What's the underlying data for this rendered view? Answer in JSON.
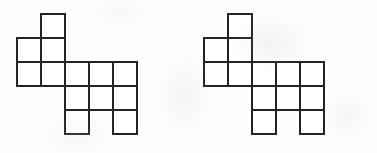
{
  "document": {
    "kind": "scanned-worksheet-figure",
    "background_color": "#fdfdfc",
    "stroke_color": "#242424",
    "stroke_width": 2.6,
    "cell_size": 24,
    "figure_count": 2
  },
  "figures": [
    {
      "id": "figure-left",
      "label": "polyomino-figure-left",
      "origin": {
        "x": 17,
        "y": 14
      },
      "grid_rows": 5,
      "grid_cols": 5,
      "cells": [
        {
          "row": 1,
          "col": 2
        },
        {
          "row": 2,
          "col": 1
        },
        {
          "row": 2,
          "col": 2
        },
        {
          "row": 3,
          "col": 1
        },
        {
          "row": 3,
          "col": 2
        },
        {
          "row": 3,
          "col": 3
        },
        {
          "row": 3,
          "col": 4
        },
        {
          "row": 3,
          "col": 5
        },
        {
          "row": 4,
          "col": 3
        },
        {
          "row": 4,
          "col": 4
        },
        {
          "row": 4,
          "col": 5
        },
        {
          "row": 5,
          "col": 3
        },
        {
          "row": 5,
          "col": 5
        }
      ]
    },
    {
      "id": "figure-right",
      "label": "polyomino-figure-right",
      "origin": {
        "x": 17,
        "y": 14
      },
      "grid_rows": 5,
      "grid_cols": 5,
      "cells": [
        {
          "row": 1,
          "col": 2
        },
        {
          "row": 2,
          "col": 1
        },
        {
          "row": 2,
          "col": 2
        },
        {
          "row": 3,
          "col": 1
        },
        {
          "row": 3,
          "col": 2
        },
        {
          "row": 3,
          "col": 3
        },
        {
          "row": 3,
          "col": 4
        },
        {
          "row": 3,
          "col": 5
        },
        {
          "row": 4,
          "col": 3
        },
        {
          "row": 4,
          "col": 4
        },
        {
          "row": 4,
          "col": 5
        },
        {
          "row": 5,
          "col": 3
        },
        {
          "row": 5,
          "col": 5
        }
      ]
    }
  ]
}
